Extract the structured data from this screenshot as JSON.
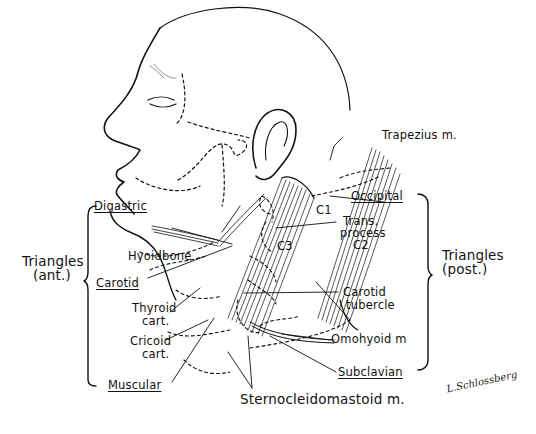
{
  "figure": {
    "title_cropped": "",
    "labels": {
      "trapezius": "Trapezius m.",
      "occipital": "Occipital",
      "c1": "C1",
      "trans_process": "Trans.",
      "trans_process_2": "process",
      "trans_process_3": "C2",
      "c3": "C3",
      "digastric": "Digastric",
      "hyoid_bone": "Hyoidbone",
      "carotid": "Carotid",
      "thyroid_cart_1": "Thyroid",
      "thyroid_cart_2": "cart.",
      "cricoid_cart_1": "Cricoid",
      "cricoid_cart_2": "cart.",
      "muscular": "Muscular",
      "carotid_tubercle_1": "Carotid",
      "carotid_tubercle_2": "tubercle",
      "omohyoid": "Omohyoid m",
      "subclavian": "Subclavian",
      "sternocleidomastoid": "Sternocleidomastoid m.",
      "triangles_ant_1": "Triangles",
      "triangles_ant_2": "(ant.)",
      "triangles_post_1": "Triangles",
      "triangles_post_2": "(post.)"
    },
    "signature": "L.Schlossberg",
    "colors": {
      "ink": "#111111",
      "background": "#ffffff"
    }
  }
}
